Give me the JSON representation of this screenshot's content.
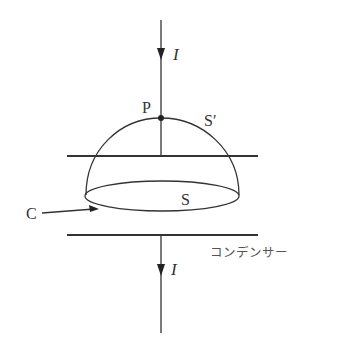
{
  "diagram": {
    "current_top_label": "I",
    "current_bottom_label": "I",
    "point_label": "P",
    "surface_dome_label": "S′",
    "surface_flat_label": "S",
    "curve_label": "C",
    "capacitor_label": "コンデンサー"
  }
}
